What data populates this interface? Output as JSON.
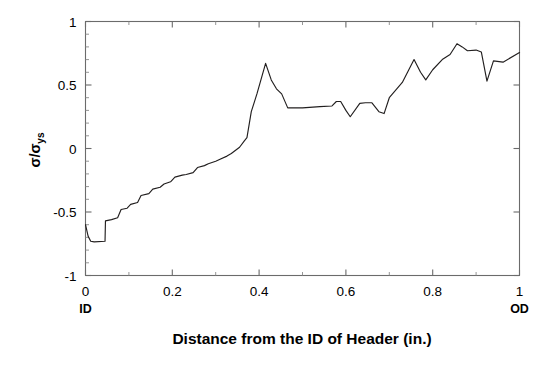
{
  "chart_data": {
    "type": "line",
    "title": "",
    "xlabel": "Distance from the ID of Header (in.)",
    "ylabel": "σ/σys",
    "ylabel_base": "σ/σ",
    "ylabel_sub": "ys",
    "xlim": [
      0,
      1
    ],
    "ylim": [
      -1,
      1
    ],
    "grid": false,
    "legend": "none",
    "xticks": [
      0,
      0.2,
      0.4,
      0.6,
      0.8,
      1
    ],
    "xticklabels": [
      "0",
      "0.2",
      "0.4",
      "0.6",
      "0.8",
      "1"
    ],
    "yticks": [
      -1,
      -0.5,
      0,
      0.5,
      1
    ],
    "yticklabels": [
      "-1",
      "-0.5",
      "0",
      "0.5",
      "1"
    ],
    "x_minor_per_major": 2,
    "y_minor_per_major": 5,
    "axis_end_labels": [
      {
        "text": "ID",
        "x": 0
      },
      {
        "text": "OD",
        "x": 1
      }
    ],
    "series": [
      {
        "name": "sigma-ratio",
        "color": "#221f1f",
        "x": [
          0.0,
          0.006,
          0.012,
          0.02,
          0.045,
          0.046,
          0.06,
          0.074,
          0.082,
          0.096,
          0.104,
          0.12,
          0.128,
          0.146,
          0.155,
          0.172,
          0.181,
          0.196,
          0.206,
          0.223,
          0.232,
          0.248,
          0.258,
          0.274,
          0.283,
          0.3,
          0.31,
          0.326,
          0.336,
          0.355,
          0.366,
          0.372,
          0.382,
          0.395,
          0.415,
          0.428,
          0.44,
          0.452,
          0.466,
          0.5,
          0.54,
          0.568,
          0.578,
          0.588,
          0.6,
          0.61,
          0.632,
          0.645,
          0.66,
          0.676,
          0.688,
          0.7,
          0.73,
          0.757,
          0.772,
          0.784,
          0.8,
          0.822,
          0.84,
          0.856,
          0.868,
          0.88,
          0.9,
          0.912,
          0.925,
          0.94,
          0.962,
          1.0
        ],
        "y": [
          -0.6,
          -0.69,
          -0.73,
          -0.735,
          -0.73,
          -0.57,
          -0.56,
          -0.545,
          -0.48,
          -0.47,
          -0.44,
          -0.425,
          -0.37,
          -0.355,
          -0.32,
          -0.305,
          -0.28,
          -0.262,
          -0.225,
          -0.21,
          -0.205,
          -0.19,
          -0.15,
          -0.135,
          -0.12,
          -0.1,
          -0.085,
          -0.06,
          -0.04,
          0.01,
          0.06,
          0.085,
          0.29,
          0.43,
          0.67,
          0.54,
          0.47,
          0.43,
          0.32,
          0.32,
          0.33,
          0.335,
          0.37,
          0.37,
          0.3,
          0.25,
          0.355,
          0.36,
          0.36,
          0.29,
          0.275,
          0.4,
          0.52,
          0.7,
          0.6,
          0.54,
          0.62,
          0.7,
          0.74,
          0.825,
          0.8,
          0.77,
          0.775,
          0.76,
          0.53,
          0.69,
          0.68,
          0.755
        ]
      }
    ]
  },
  "axes": {
    "y_title_parts": {
      "base": "σ/σ",
      "sub": "ys"
    }
  }
}
